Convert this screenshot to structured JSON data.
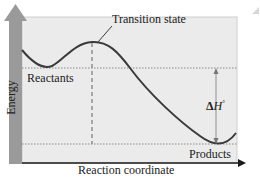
{
  "diagram": {
    "labels": {
      "transition_state": "Transition state",
      "reactants": "Reactants",
      "products": "Products",
      "delta_h_symbol": "Δ",
      "delta_h_var": "H",
      "delta_h_sup": "°",
      "x_axis": "Reaction coordinate",
      "y_axis": "Energy"
    },
    "colors": {
      "plot_background": "#ebebeb",
      "axis_bar": "#9a9a9a",
      "curve": "#3a3a3a",
      "dotted_lines": "#8a8a8a",
      "arrow": "#1a1a1a"
    }
  }
}
